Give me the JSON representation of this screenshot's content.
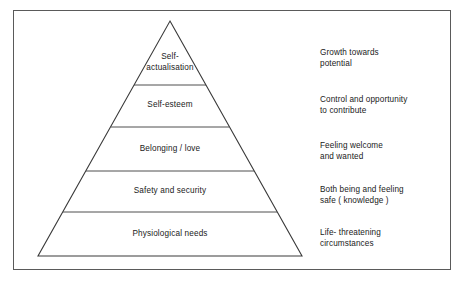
{
  "figure": {
    "name": "maslow-hierarchy-of-needs-pyramid",
    "border_color": "#5a5a5a",
    "line_color": "#3a3a3a",
    "text_color": "#1a1a1a",
    "background": "#ffffff"
  },
  "pyramid": {
    "tiers": [
      {
        "id": "self-actualisation",
        "label": "Self-\nactualisation",
        "order": 1,
        "position": "top"
      },
      {
        "id": "self-esteem",
        "label": "Self-esteem",
        "order": 2,
        "position": "upper-middle"
      },
      {
        "id": "belonging-love",
        "label": "Belonging / love",
        "order": 3,
        "position": "middle"
      },
      {
        "id": "safety-and-security",
        "label": "Safety and security",
        "order": 4,
        "position": "lower-middle"
      },
      {
        "id": "physiological-needs",
        "label": "Physiological needs",
        "order": 5,
        "position": "base"
      }
    ]
  },
  "annotations": [
    {
      "id": "growth-towards-potential",
      "text": "Growth towards\npotential",
      "for_tier": "self-actualisation"
    },
    {
      "id": "control-and-opportunity",
      "text": "Control and opportunity\nto contribute",
      "for_tier": "self-esteem"
    },
    {
      "id": "feeling-welcome",
      "text": "Feeling welcome\nand wanted",
      "for_tier": "belonging-love"
    },
    {
      "id": "both-being-and-feeling-safe",
      "text": "Both being and feeling\nsafe  ( knowledge )",
      "for_tier": "safety-and-security"
    },
    {
      "id": "life-threatening-circumstances",
      "text": "Life- threatening\ncircumstances",
      "for_tier": "physiological-needs"
    }
  ]
}
